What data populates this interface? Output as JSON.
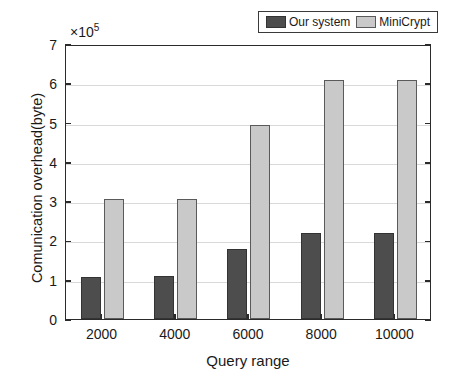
{
  "chart_data": {
    "type": "bar",
    "title": "",
    "xlabel": "Query range",
    "ylabel": "Comunication overhead(byte)",
    "exponent_label": "×10",
    "exponent_power": "5",
    "categories": [
      "2000",
      "4000",
      "6000",
      "8000",
      "10000"
    ],
    "series": [
      {
        "name": "Our system",
        "color": "#4d4d4d",
        "values": [
          1.08,
          1.09,
          1.77,
          2.18,
          2.18
        ]
      },
      {
        "name": "MiniCrypt",
        "color": "#c9c9c9",
        "values": [
          3.05,
          3.05,
          4.94,
          6.08,
          6.08
        ]
      }
    ],
    "unit_scale": 100000,
    "ylim": [
      0,
      7
    ],
    "yticks": [
      "0",
      "1",
      "2",
      "3",
      "4",
      "5",
      "6",
      "7"
    ],
    "grid": true,
    "legend_position": "top-right"
  },
  "legend": {
    "entries": [
      {
        "label": "Our system",
        "swatch": "dark-gray-swatch"
      },
      {
        "label": "MiniCrypt",
        "swatch": "light-gray-swatch"
      }
    ]
  }
}
